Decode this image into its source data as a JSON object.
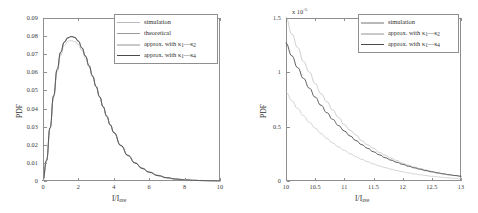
{
  "figure": {
    "background": "#ffffff",
    "panels": [
      "left",
      "right"
    ]
  },
  "colors": {
    "simulation": "#b9b9b9",
    "theoretical": "#9a9a9a",
    "approx_k1_k2": "#c9c9c9",
    "approx_k1_k4": "#4a4a4a",
    "axis": "#8f8f8f",
    "text": "#2f2f2f"
  },
  "legend_labels": {
    "simulation": "simulation",
    "theoretical": "theoretical",
    "approx_k1_k2_pre": "approx. with ",
    "approx_k1_k2_kappa": "κ",
    "approx_k1_k2_sub1": "1",
    "approx_k1_k2_dash": "—",
    "approx_k1_k2_sub2": "2",
    "approx_k1_k4_sub2": "4"
  },
  "axis_text": {
    "pdf": "PDF",
    "ratio_main": "I/I",
    "ratio_sub": "ave",
    "exponent_prefix": "x 10",
    "exponent_power": "-5"
  },
  "chart_data": [
    {
      "id": "left-panel",
      "type": "line",
      "title": "",
      "xlabel": "I/I_ave",
      "ylabel": "PDF",
      "xlim": [
        0,
        10
      ],
      "ylim": [
        0,
        0.09
      ],
      "xticks": [
        "0",
        "2",
        "4",
        "6",
        "8",
        "10"
      ],
      "xtick_values": [
        0,
        2,
        4,
        6,
        8,
        10
      ],
      "yticks": [
        "0",
        "0.01",
        "0.02",
        "0.03",
        "0.04",
        "0.05",
        "0.06",
        "0.07",
        "0.08",
        "0.09"
      ],
      "ytick_values": [
        0,
        0.01,
        0.02,
        0.03,
        0.04,
        0.05,
        0.06,
        0.07,
        0.08,
        0.09
      ],
      "grid": false,
      "legend_position": "top-right",
      "legend_entries": [
        "simulation",
        "theoretical",
        "approx. with κ1—κ2",
        "approx. with κ1—κ4"
      ],
      "x": [
        0,
        0.2,
        0.4,
        0.6,
        0.8,
        1.0,
        1.2,
        1.4,
        1.6,
        1.8,
        2.0,
        2.2,
        2.4,
        2.6,
        2.8,
        3.0,
        3.2,
        3.4,
        3.6,
        3.8,
        4.0,
        4.4,
        4.8,
        5.2,
        5.6,
        6.0,
        6.5,
        7.0,
        7.5,
        8.0,
        8.5,
        9.0,
        9.5,
        10.0
      ],
      "series": [
        {
          "name": "simulation",
          "color": "#b9b9b9",
          "values": [
            0.0,
            0.0115,
            0.0295,
            0.047,
            0.0615,
            0.071,
            0.0765,
            0.079,
            0.0797,
            0.0793,
            0.0772,
            0.0735,
            0.069,
            0.0637,
            0.058,
            0.0522,
            0.0465,
            0.041,
            0.0358,
            0.031,
            0.0268,
            0.0196,
            0.0141,
            0.01,
            0.007,
            0.0049,
            0.003,
            0.0018,
            0.0011,
            0.00065,
            0.00038,
            0.00022,
            0.00013,
            8e-05
          ]
        },
        {
          "name": "theoretical",
          "color": "#9a9a9a",
          "values": [
            0.0,
            0.0112,
            0.0292,
            0.0468,
            0.0613,
            0.0709,
            0.0764,
            0.0789,
            0.0796,
            0.0792,
            0.0771,
            0.0734,
            0.0689,
            0.0636,
            0.0579,
            0.0521,
            0.0464,
            0.0409,
            0.0357,
            0.0309,
            0.0267,
            0.0195,
            0.014,
            0.0099,
            0.0069,
            0.0048,
            0.0029,
            0.0017,
            0.001,
            0.00062,
            0.00036,
            0.00021,
            0.00012,
            7e-05
          ]
        },
        {
          "name": "approx. with κ1—κ2",
          "color": "#c9c9c9",
          "values": [
            0.0,
            0.011,
            0.0288,
            0.0458,
            0.06,
            0.0693,
            0.0747,
            0.0771,
            0.0775,
            0.077,
            0.0752,
            0.072,
            0.0678,
            0.0628,
            0.0574,
            0.0518,
            0.0463,
            0.041,
            0.0359,
            0.0312,
            0.027,
            0.0199,
            0.0144,
            0.0103,
            0.0073,
            0.0051,
            0.0032,
            0.0019,
            0.0012,
            0.00072,
            0.00043,
            0.00025,
            0.00015,
            9e-05
          ]
        },
        {
          "name": "approx. with κ1—κ4",
          "color": "#4a4a4a",
          "values": [
            0.0,
            0.0114,
            0.0294,
            0.047,
            0.0616,
            0.0712,
            0.0767,
            0.0791,
            0.0798,
            0.0793,
            0.0772,
            0.0735,
            0.069,
            0.0637,
            0.058,
            0.0522,
            0.0465,
            0.041,
            0.0358,
            0.031,
            0.0268,
            0.0196,
            0.0141,
            0.01,
            0.007,
            0.0049,
            0.003,
            0.0018,
            0.0011,
            0.00065,
            0.00038,
            0.00022,
            0.00013,
            8e-05
          ]
        }
      ]
    },
    {
      "id": "right-panel",
      "type": "line",
      "title": "",
      "xlabel": "I/I_ave",
      "ylabel": "PDF",
      "y_multiplier": "x 10^-5",
      "xlim": [
        10,
        13
      ],
      "ylim": [
        0,
        1.5
      ],
      "xticks": [
        "10",
        "10.5",
        "11",
        "11.5",
        "12",
        "12.5",
        "13"
      ],
      "xtick_values": [
        10,
        10.5,
        11,
        11.5,
        12,
        12.5,
        13
      ],
      "yticks": [
        "0",
        "0.5",
        "1",
        "1.5"
      ],
      "ytick_values": [
        0,
        0.5,
        1.0,
        1.5
      ],
      "grid": false,
      "legend_position": "top-right",
      "legend_entries": [
        "simulation",
        "approx. with κ1—κ2",
        "approx. with κ1—κ4"
      ],
      "x": [
        10.0,
        10.1,
        10.2,
        10.3,
        10.4,
        10.5,
        10.6,
        10.7,
        10.8,
        10.9,
        11.0,
        11.1,
        11.2,
        11.3,
        11.4,
        11.5,
        11.6,
        11.7,
        11.8,
        11.9,
        12.0,
        12.1,
        12.2,
        12.3,
        12.4,
        12.5,
        12.6,
        12.7,
        12.8,
        12.9,
        13.0
      ],
      "series": [
        {
          "name": "simulation",
          "color": "#b9b9b9",
          "noisy": true,
          "values": [
            1.5,
            1.36,
            1.22,
            1.1,
            1.0,
            0.895,
            0.805,
            0.725,
            0.65,
            0.585,
            0.525,
            0.47,
            0.42,
            0.376,
            0.336,
            0.3,
            0.267,
            0.237,
            0.211,
            0.187,
            0.166,
            0.147,
            0.13,
            0.114,
            0.1,
            0.088,
            0.077,
            0.067,
            0.058,
            0.05,
            0.043
          ]
        },
        {
          "name": "approx. with κ1—κ2",
          "color": "#c9c9c9",
          "values": [
            0.82,
            0.74,
            0.667,
            0.601,
            0.541,
            0.487,
            0.437,
            0.392,
            0.351,
            0.314,
            0.281,
            0.251,
            0.224,
            0.199,
            0.177,
            0.157,
            0.139,
            0.123,
            0.109,
            0.096,
            0.085,
            0.074,
            0.065,
            0.057,
            0.05,
            0.043,
            0.038,
            0.033,
            0.028,
            0.024,
            0.021
          ]
        },
        {
          "name": "approx. with κ1—κ4",
          "color": "#4a4a4a",
          "values": [
            1.27,
            1.152,
            1.043,
            0.944,
            0.854,
            0.772,
            0.697,
            0.629,
            0.567,
            0.511,
            0.46,
            0.414,
            0.372,
            0.334,
            0.3,
            0.269,
            0.241,
            0.215,
            0.192,
            0.172,
            0.153,
            0.136,
            0.121,
            0.108,
            0.095,
            0.084,
            0.074,
            0.065,
            0.057,
            0.05,
            0.044
          ]
        }
      ]
    }
  ]
}
